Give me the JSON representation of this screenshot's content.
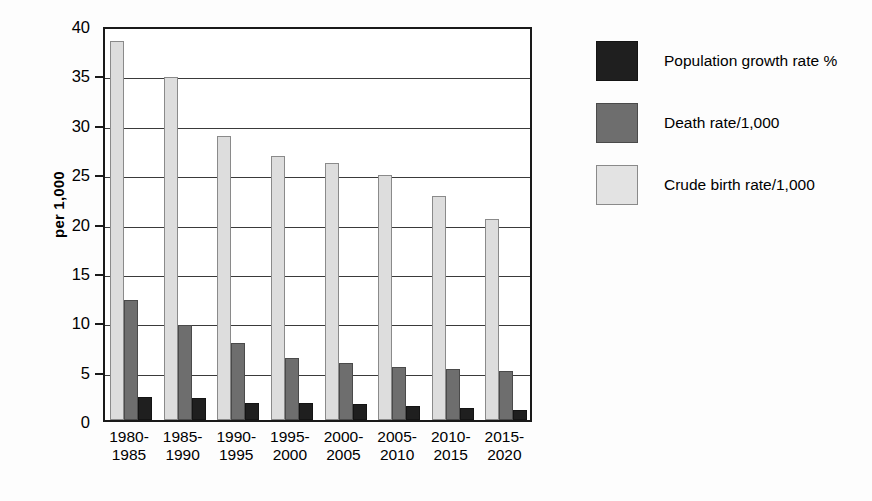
{
  "chart_data": {
    "type": "bar",
    "title": "",
    "xlabel": "",
    "ylabel": "per 1,000",
    "ylim": [
      0,
      40
    ],
    "ytick_values": [
      0,
      5,
      10,
      15,
      20,
      25,
      30,
      35,
      40
    ],
    "ytick_labels": [
      "0",
      "5",
      "10",
      "15",
      "20",
      "25",
      "30",
      "35",
      "40"
    ],
    "grid": true,
    "legend_position": "right",
    "bar_order_in_group": [
      "Crude birth rate/1,000",
      "Death rate/1,000",
      "Population growth rate %"
    ],
    "categories": [
      "1980-1985",
      "1985-1990",
      "1990-1995",
      "1995-2000",
      "2000-2005",
      "2005-2010",
      "2010-2015",
      "2015-2020"
    ],
    "category_lines": [
      [
        "1980-",
        "1985"
      ],
      [
        "1985-",
        "1990"
      ],
      [
        "1990-",
        "1995"
      ],
      [
        "1995-",
        "2000"
      ],
      [
        "2000-",
        "2005"
      ],
      [
        "2005-",
        "2010"
      ],
      [
        "2010-",
        "2015"
      ],
      [
        "2015-",
        "2020"
      ]
    ],
    "series": [
      {
        "name": "Population growth rate %",
        "key": "growth",
        "color": "#1f1f1f",
        "values": [
          2.3,
          2.2,
          1.7,
          1.7,
          1.6,
          1.4,
          1.2,
          1.0
        ]
      },
      {
        "name": "Death rate/1,000",
        "key": "death",
        "color": "#6e6e6e",
        "values": [
          12.2,
          9.6,
          7.8,
          6.3,
          5.8,
          5.4,
          5.2,
          5.0
        ]
      },
      {
        "name": "Crude birth rate/1,000",
        "key": "crude",
        "color": "#dddddd",
        "values": [
          38.4,
          34.7,
          28.8,
          26.7,
          26.0,
          24.8,
          22.7,
          20.4
        ]
      }
    ]
  },
  "legend": {
    "items": [
      {
        "label": "Population growth rate %",
        "key": "growth"
      },
      {
        "label": "Death rate/1,000",
        "key": "death"
      },
      {
        "label": "Crude birth rate/1,000",
        "key": "crude"
      }
    ]
  }
}
